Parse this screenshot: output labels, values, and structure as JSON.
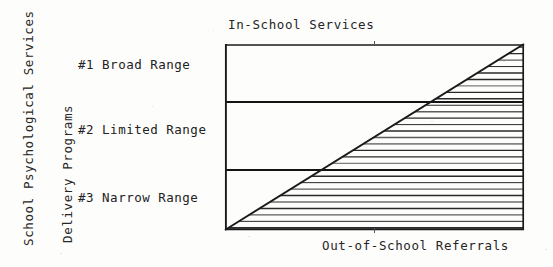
{
  "figure": {
    "vertical_captions": [
      {
        "id": "school-psychological-services",
        "text": "School Psychological Services"
      },
      {
        "id": "delivery-programs",
        "text": "Delivery Programs"
      }
    ],
    "range_labels": [
      {
        "id": "broad",
        "text": "#1 Broad Range"
      },
      {
        "id": "limited",
        "text": "#2 Limited Range"
      },
      {
        "id": "narrow",
        "text": "#3 Narrow Range"
      }
    ],
    "ink_color": "#1a1a1a",
    "paper_color": "#fdfdfc"
  },
  "chart_data": {
    "type": "area",
    "title": "In-School Services",
    "xlabel": "Out-of-School Referrals",
    "ylabel": "In-School Services",
    "xlim": [
      0,
      1
    ],
    "ylim": [
      0,
      1
    ],
    "grid": false,
    "legend": "none",
    "x": [
      0,
      1
    ],
    "series": [
      {
        "name": "Out-of-School Referrals",
        "values": [
          0,
          1
        ],
        "fill": "horizontal-hatch",
        "note": "Region below the diagonal is hatched with horizontal rules"
      }
    ],
    "band_boundaries": [
      0.3226,
      0.6882
    ],
    "bands": [
      {
        "label": "#1 Broad Range",
        "y_from": 0.6882,
        "y_to": 1.0
      },
      {
        "label": "#2 Limited Range",
        "y_from": 0.3226,
        "y_to": 0.6882
      },
      {
        "label": "#3 Narrow Range",
        "y_from": 0.0,
        "y_to": 0.3226
      }
    ],
    "annotations": [
      "Diagonal rises from the origin to the upper-right corner",
      "Area under the diagonal is filled with horizontal hatch lines"
    ]
  }
}
